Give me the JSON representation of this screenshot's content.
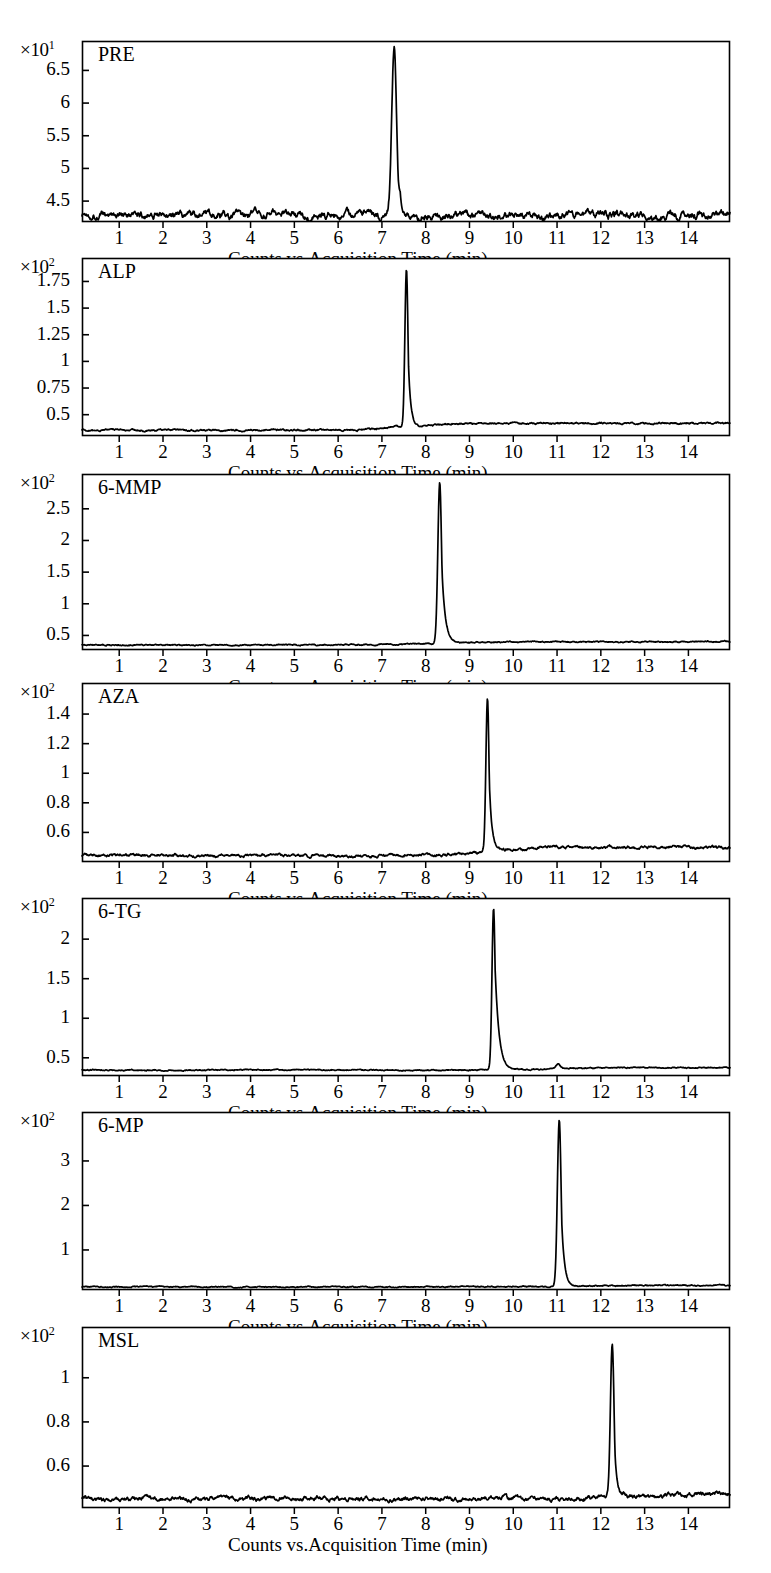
{
  "figure": {
    "background": "#ffffff",
    "trace_color": "#000000",
    "axis_color": "#000000",
    "width": 771,
    "height": 1573,
    "panel_count": 7
  },
  "axis_caption": "Counts vs.Acquisition Time (min)",
  "x_tick_labels": [
    "1",
    "2",
    "3",
    "4",
    "5",
    "6",
    "7",
    "8",
    "9",
    "10",
    "11",
    "12",
    "13",
    "14"
  ],
  "chart_data": [
    {
      "type": "line",
      "title": "PRE",
      "xlabel": "Counts vs.Acquisition Time (min)",
      "ylabel": "",
      "y_exponent_label": "×10",
      "y_exponent_sup": "1",
      "y_scale": 10,
      "xlim": [
        0.15,
        14.95
      ],
      "ylim": [
        4.18,
        6.95
      ],
      "yticks": [
        "4.5",
        "5",
        "5.5",
        "6",
        "6.5"
      ],
      "ytick_values": [
        4.5,
        5,
        5.5,
        6,
        6.5
      ],
      "xticks": [
        1,
        2,
        3,
        4,
        5,
        6,
        7,
        8,
        9,
        10,
        11,
        12,
        13,
        14
      ],
      "grid": false,
      "baseline": 4.3,
      "noise_amplitude": 0.055,
      "peaks": [
        {
          "rt": 7.28,
          "height": 6.86,
          "width": 0.055,
          "tail": 0.07
        }
      ],
      "peak_label": "PRE peak at 7.28 min, apex ≈ 6.86×10¹ counts"
    },
    {
      "type": "line",
      "title": "ALP",
      "xlabel": "Counts vs.Acquisition Time (min)",
      "ylabel": "",
      "y_exponent_label": "×10",
      "y_exponent_sup": "2",
      "y_scale": 100,
      "xlim": [
        0.15,
        14.95
      ],
      "ylim": [
        0.3,
        1.97
      ],
      "yticks": [
        "0.5",
        "0.75",
        "1",
        "1.25",
        "1.5",
        "1.75"
      ],
      "ytick_values": [
        0.5,
        0.75,
        1,
        1.25,
        1.5,
        1.75
      ],
      "xticks": [
        1,
        2,
        3,
        4,
        5,
        6,
        7,
        8,
        9,
        10,
        11,
        12,
        13,
        14
      ],
      "grid": false,
      "baseline": 0.355,
      "baseline_after": 0.42,
      "noise_amplitude": 0.008,
      "peaks": [
        {
          "rt": 7.56,
          "height": 1.875,
          "width": 0.035,
          "tail": 0.055
        }
      ],
      "peak_label": "ALP peak at 7.56 min, apex ≈ 1.88×10² counts"
    },
    {
      "type": "line",
      "title": "6-MMP",
      "xlabel": "Counts vs.Acquisition Time (min)",
      "ylabel": "",
      "y_exponent_label": "×10",
      "y_exponent_sup": "2",
      "y_scale": 100,
      "xlim": [
        0.15,
        14.95
      ],
      "ylim": [
        0.27,
        3.05
      ],
      "yticks": [
        "0.5",
        "1",
        "1.5",
        "2",
        "2.5"
      ],
      "ytick_values": [
        0.5,
        1,
        1.5,
        2,
        2.5
      ],
      "xticks": [
        1,
        2,
        3,
        4,
        5,
        6,
        7,
        8,
        9,
        10,
        11,
        12,
        13,
        14
      ],
      "grid": false,
      "baseline": 0.35,
      "baseline_after": 0.4,
      "noise_amplitude": 0.009,
      "peaks": [
        {
          "rt": 8.32,
          "height": 2.9,
          "width": 0.042,
          "tail": 0.075
        }
      ],
      "peak_label": "6-MMP peak at 8.32 min, apex ≈ 2.90×10² counts"
    },
    {
      "type": "line",
      "title": "AZA",
      "xlabel": "Counts vs.Acquisition Time (min)",
      "ylabel": "",
      "y_exponent_label": "×10",
      "y_exponent_sup": "2",
      "y_scale": 100,
      "xlim": [
        0.15,
        14.95
      ],
      "ylim": [
        0.4,
        1.61
      ],
      "yticks": [
        "0.6",
        "0.8",
        "1",
        "1.2",
        "1.4"
      ],
      "ytick_values": [
        0.6,
        0.8,
        1,
        1.2,
        1.4
      ],
      "xticks": [
        1,
        2,
        3,
        4,
        5,
        6,
        7,
        8,
        9,
        10,
        11,
        12,
        13,
        14
      ],
      "grid": false,
      "baseline": 0.445,
      "baseline_after": 0.5,
      "noise_amplitude": 0.009,
      "peaks": [
        {
          "rt": 9.41,
          "height": 1.5,
          "width": 0.035,
          "tail": 0.06
        }
      ],
      "peak_label": "AZA peak at 9.41 min, apex ≈ 1.50×10² counts"
    },
    {
      "type": "line",
      "title": "6-TG",
      "xlabel": "Counts vs.Acquisition Time (min)",
      "ylabel": "",
      "y_exponent_label": "×10",
      "y_exponent_sup": "2",
      "y_scale": 100,
      "xlim": [
        0.15,
        14.95
      ],
      "ylim": [
        0.27,
        2.52
      ],
      "yticks": [
        "0.5",
        "1",
        "1.5",
        "2"
      ],
      "ytick_values": [
        0.5,
        1,
        1.5,
        2
      ],
      "xticks": [
        1,
        2,
        3,
        4,
        5,
        6,
        7,
        8,
        9,
        10,
        11,
        12,
        13,
        14
      ],
      "grid": false,
      "baseline": 0.345,
      "baseline_after": 0.375,
      "noise_amplitude": 0.007,
      "peaks": [
        {
          "rt": 9.55,
          "height": 2.39,
          "width": 0.036,
          "tail": 0.09
        },
        {
          "rt": 11.02,
          "height": 0.42,
          "width": 0.05,
          "tail": 0.05
        }
      ],
      "peak_label": "6-TG peak at 9.55 min, apex ≈ 2.39×10² counts"
    },
    {
      "type": "line",
      "title": "6-MP",
      "xlabel": "Counts vs.Acquisition Time (min)",
      "ylabel": "",
      "y_exponent_label": "×10",
      "y_exponent_sup": "2",
      "y_scale": 100,
      "xlim": [
        0.15,
        14.95
      ],
      "ylim": [
        0.1,
        4.1
      ],
      "yticks": [
        "1",
        "2",
        "3"
      ],
      "ytick_values": [
        1,
        2,
        3
      ],
      "xticks": [
        1,
        2,
        3,
        4,
        5,
        6,
        7,
        8,
        9,
        10,
        11,
        12,
        13,
        14
      ],
      "grid": false,
      "baseline": 0.17,
      "baseline_after": 0.2,
      "noise_amplitude": 0.012,
      "peaks": [
        {
          "rt": 11.05,
          "height": 3.93,
          "width": 0.042,
          "tail": 0.065
        }
      ],
      "peak_label": "6-MP peak at 11.05 min, apex ≈ 3.93×10² counts"
    },
    {
      "type": "line",
      "title": "MSL",
      "xlabel": "Counts vs.Acquisition Time (min)",
      "ylabel": "",
      "y_exponent_label": "×10",
      "y_exponent_sup": "2",
      "y_scale": 100,
      "xlim": [
        0.15,
        14.95
      ],
      "ylim": [
        0.41,
        1.23
      ],
      "yticks": [
        "0.6",
        "0.8",
        "1"
      ],
      "ytick_values": [
        0.6,
        0.8,
        1
      ],
      "xticks": [
        1,
        2,
        3,
        4,
        5,
        6,
        7,
        8,
        9,
        10,
        11,
        12,
        13,
        14
      ],
      "grid": false,
      "baseline": 0.452,
      "baseline_after": 0.472,
      "noise_amplitude": 0.009,
      "peaks": [
        {
          "rt": 12.26,
          "height": 1.155,
          "width": 0.04,
          "tail": 0.055
        }
      ],
      "peak_label": "MSL peak at 12.26 min, apex ≈ 1.16×10² counts"
    }
  ],
  "panel_geometry": [
    {
      "top": 41,
      "bottom": 222,
      "left": 82,
      "right": 730
    },
    {
      "top": 258,
      "bottom": 436,
      "left": 82,
      "right": 730
    },
    {
      "top": 474,
      "bottom": 650,
      "left": 82,
      "right": 730
    },
    {
      "top": 683,
      "bottom": 862,
      "left": 82,
      "right": 730
    },
    {
      "top": 898,
      "bottom": 1076,
      "left": 82,
      "right": 730
    },
    {
      "top": 1112,
      "bottom": 1290,
      "left": 82,
      "right": 730
    },
    {
      "top": 1327,
      "bottom": 1508,
      "left": 82,
      "right": 730
    }
  ]
}
